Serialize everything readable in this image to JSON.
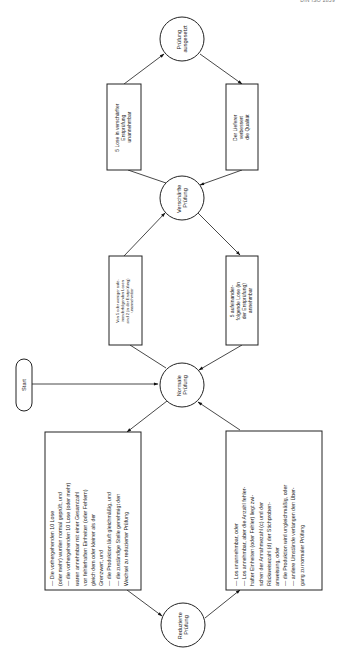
{
  "header": {
    "text": "DIN ISO 2859"
  },
  "nodes": {
    "start": {
      "label": "Start"
    },
    "normal": {
      "line1": "Normale",
      "line2": "Prüfung"
    },
    "tightened": {
      "line1": "Verschärfte",
      "line2": "Prüfung"
    },
    "suspended": {
      "line1": "Prüfung",
      "line2": "ausgesetzt"
    },
    "reduced": {
      "line1": "Reduzierte",
      "line2": "Prüfung"
    }
  },
  "conditions": {
    "normal_to_tightened": {
      "lines": [
        "Von 5 oder weniger aufe-",
        "inanderfolgenden Losen",
        "sind 2 (in der Erstprüfung)",
        "unannehmbar"
      ]
    },
    "tightened_to_normal": {
      "lines": [
        "5 aufeinander-",
        "folgende Lose (in",
        "der Erstprüfung)",
        "annehmbar"
      ]
    },
    "tightened_to_suspended": {
      "lines": [
        "5 Lose in verschärfter",
        "Erstprüfung",
        "unannehmbar"
      ]
    },
    "suspended_to_tightened": {
      "lines": [
        "Der Lieferer",
        "verbessert",
        "die Qualität"
      ]
    },
    "normal_to_reduced": {
      "lines": [
        "— Die vorhergehenden 10 Lose",
        "   (oder mehr) wurden normal geprüft, und",
        "— die vorhergehenden 10 Lose (oder mehr)",
        "   waren annehmbar mit einer Gesamtzahl",
        "   von fehlerhaften Einheiten (oder Fehlern)",
        "   gleich dem oder kleiner als der",
        "   Grenzwert, und",
        "— die Produktion läuft gleichmäßig, und",
        "— die zuständige Stelle genehmigt den",
        "   Wechsel zu reduzierter Prüfung"
      ]
    },
    "reduced_to_normal": {
      "lines": [
        "— Los unannehmbar, oder",
        "— Los annehmbar, aber die Anzahl fehler-",
        "   hafter Einheiten (oder Fehler) liegt zwi-",
        "   schen der Annahmezahl (c) und der",
        "   Rückweisezahl (d) der Stichproben-",
        "   anweisung, oder",
        "— die Produktion wird ungleichmäßig, oder",
        "— andere Umstände verlangen den Über-",
        "   gang zu normaler Prüfung"
      ]
    }
  },
  "colors": {
    "stroke": "#222222",
    "background": "#ffffff"
  }
}
